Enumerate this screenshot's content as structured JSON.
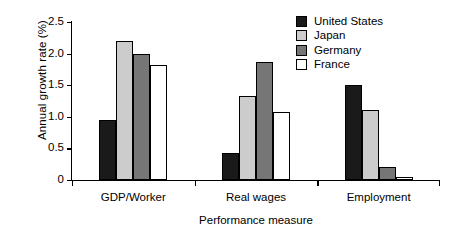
{
  "chart_data": {
    "type": "bar",
    "title": "",
    "subtitle": "",
    "xlabel": "Performance measure",
    "ylabel": "Annual growth rate (%)",
    "categories": [
      "GDP/Worker",
      "Real wages",
      "Employment"
    ],
    "series": [
      {
        "name": "United States",
        "color": "#1a1a1a",
        "values": [
          0.95,
          0.42,
          1.5
        ]
      },
      {
        "name": "Japan",
        "color": "#cccccc",
        "values": [
          2.2,
          1.33,
          1.1
        ]
      },
      {
        "name": "Germany",
        "color": "#767676",
        "values": [
          2.0,
          1.86,
          0.2
        ]
      },
      {
        "name": "France",
        "color": "#ffffff",
        "values": [
          1.82,
          1.08,
          0.05
        ]
      }
    ],
    "ylim": [
      0,
      2.5
    ],
    "yticks": [
      0,
      0.5,
      1.0,
      1.5,
      2.0,
      2.5
    ],
    "ytick_labels": [
      "0",
      "0.5",
      "1.0",
      "1.5",
      "2.0",
      "2.5"
    ],
    "grid": false,
    "legend_position": "top-right",
    "bar_edge_color": "#000000",
    "axis_color": "#000000"
  }
}
